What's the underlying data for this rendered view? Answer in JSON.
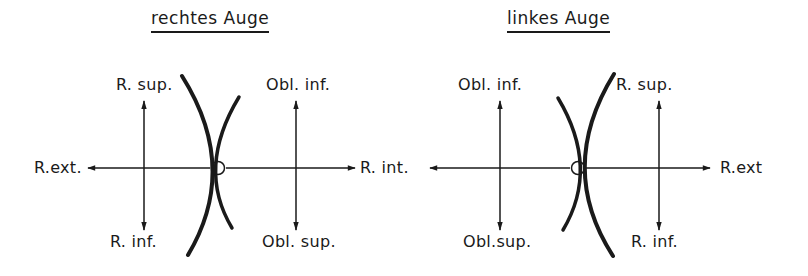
{
  "diagrams": [
    {
      "title": "rechtes Auge",
      "labels": {
        "top_left": "R. sup.",
        "top_right": "Obl. inf.",
        "bottom_left": "R. inf.",
        "bottom_right": "Obl. sup.",
        "left": "R.ext.",
        "right": "R. int."
      }
    },
    {
      "title": "linkes Auge",
      "labels": {
        "top_left": "Obl. inf.",
        "top_right": "R. sup.",
        "bottom_left": "Obl.sup.",
        "bottom_right": "R. inf.",
        "left": "R. int.",
        "right": "R.ext"
      }
    }
  ],
  "colors": {
    "ink": "#1a1a1a",
    "background": "#ffffff"
  }
}
